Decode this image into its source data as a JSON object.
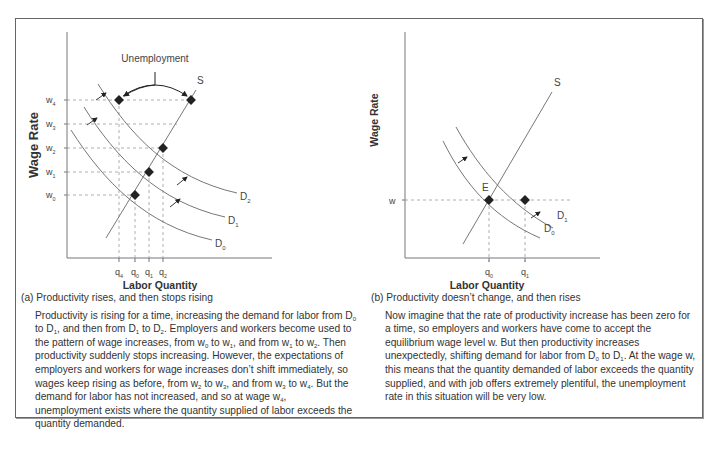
{
  "chart_data": [
    {
      "type": "line",
      "panel": "a",
      "title": "Productivity rises, and then stops rising",
      "panel_label": "(a)",
      "xlabel": "Labor Quantity",
      "ylabel": "Wage Rate",
      "x_ticks": [
        "q4",
        "q0",
        "q1",
        "q2"
      ],
      "y_ticks": [
        "w0",
        "w1",
        "w2",
        "w3",
        "w4"
      ],
      "series": [
        {
          "name": "S",
          "kind": "supply"
        },
        {
          "name": "D0",
          "kind": "demand"
        },
        {
          "name": "D1",
          "kind": "demand"
        },
        {
          "name": "D2",
          "kind": "demand"
        }
      ],
      "points": [
        {
          "label": "w0-q0 on D0 and S",
          "x": "q0",
          "y": "w0"
        },
        {
          "label": "w1-q1 on D1 and S",
          "x": "q1",
          "y": "w1"
        },
        {
          "label": "w2-q2 on D2 and S",
          "x": "q2",
          "y": "w2"
        },
        {
          "label": "w4-q4 on D2",
          "x": "q4",
          "y": "w4"
        },
        {
          "label": "w4 on S",
          "x": "S",
          "y": "w4"
        }
      ],
      "annotation": "Unemployment",
      "grid": false
    },
    {
      "type": "line",
      "panel": "b",
      "title": "Productivity doesn't change, and then rises",
      "panel_label": "(b)",
      "xlabel": "Labor Quantity",
      "ylabel": "Wage Rate",
      "x_ticks": [
        "q0",
        "q1"
      ],
      "y_ticks": [
        "w"
      ],
      "series": [
        {
          "name": "S",
          "kind": "supply"
        },
        {
          "name": "D0",
          "kind": "demand"
        },
        {
          "name": "D1",
          "kind": "demand"
        }
      ],
      "points": [
        {
          "label": "E",
          "x": "q0",
          "y": "w"
        },
        {
          "label": "w-q1 on D1",
          "x": "q1",
          "y": "w"
        }
      ],
      "grid": false
    }
  ],
  "panel_a": {
    "ylabel": "Wage Rate",
    "xlabel": "Labor Quantity",
    "annotation": "Unemployment",
    "supply_label": "S",
    "demand_labels": [
      "D",
      "D",
      "D"
    ],
    "demand_subs": [
      "0",
      "1",
      "2"
    ],
    "w_ticks": [
      {
        "base": "w",
        "sub": "0"
      },
      {
        "base": "w",
        "sub": "1"
      },
      {
        "base": "w",
        "sub": "2"
      },
      {
        "base": "w",
        "sub": "3"
      },
      {
        "base": "w",
        "sub": "4"
      }
    ],
    "q_ticks": [
      {
        "base": "q",
        "sub": "4"
      },
      {
        "base": "q",
        "sub": "0"
      },
      {
        "base": "q",
        "sub": "1"
      },
      {
        "base": "q",
        "sub": "2"
      }
    ],
    "caption_title": "(a) Productivity rises, and then stops rising",
    "caption_html": "Productivity is rising for a time, increasing the demand for labor from D<sub>0</sub> to D<sub>1</sub>, and then from D<sub>1</sub> to D<sub>2</sub>. Employers and workers become used to the pattern of wage increases, from w<sub>0</sub> to w<sub>1</sub>, and from w<sub>1</sub> to w<sub>2</sub>. Then productivity suddenly stops increasing. However, the expectations of employers and workers for wage increases don’t shift immediately, so wages keep rising as before, from w<sub>2</sub> to w<sub>3</sub>, and from w<sub>3</sub> to w<sub>4</sub>. But the demand for labor has not increased, and so at wage w<sub>4</sub>, unemployment exists where the quantity supplied of labor exceeds the quantity demanded."
  },
  "panel_b": {
    "ylabel": "Wage Rate",
    "xlabel": "Labor Quantity",
    "supply_label": "S",
    "equilibrium_label": "E",
    "w_tick": "w",
    "demand_subs": [
      "0",
      "1"
    ],
    "q_ticks": [
      {
        "base": "q",
        "sub": "0"
      },
      {
        "base": "q",
        "sub": "1"
      }
    ],
    "caption_title": "(b) Productivity doesn’t change, and then rises",
    "caption_html": "Now imagine that the rate of productivity increase has been zero for a time, so employers and workers have come to accept the equilibrium wage level w. But then productivity increases unexpectedly, shifting demand for labor from D<sub>0</sub> to D<sub>1</sub>. At the wage w, this means that the quantity demanded of labor exceeds the quantity supplied, and with job offers extremely plentiful, the unemployment rate in this situation will be very low."
  },
  "colors": {
    "line": "#777777",
    "dash": "#999999",
    "dot": "#222222",
    "text": "#333333",
    "frame": "#666666"
  }
}
